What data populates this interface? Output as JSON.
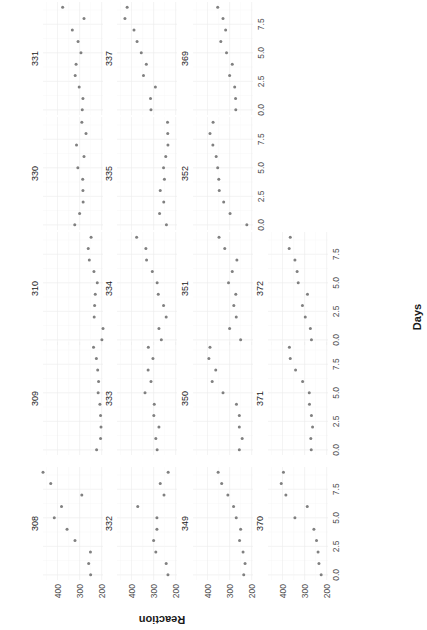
{
  "chart_data": {
    "type": "scatter",
    "title": "",
    "xlabel": "Days",
    "ylabel": "Reaction",
    "x_ticks": [
      "0.0",
      "2.5",
      "5.0",
      "7.5"
    ],
    "y_ticks": [
      "200",
      "300",
      "400"
    ],
    "xlim": [
      -0.45,
      9.45
    ],
    "ylim": [
      194,
      466
    ],
    "grid": true,
    "legend": "none",
    "facet_layout": {
      "ncol": 5,
      "nrow": 4
    },
    "x": [
      0,
      1,
      2,
      3,
      4,
      5,
      6,
      7,
      8,
      9
    ],
    "facets": [
      {
        "subject": "308",
        "values": [
          250,
          259,
          251,
          321,
          357,
          415,
          382,
          290,
          431,
          466
        ]
      },
      {
        "subject": "309",
        "values": [
          223,
          205,
          203,
          205,
          208,
          216,
          214,
          218,
          224,
          237
        ]
      },
      {
        "subject": "310",
        "values": [
          199,
          194,
          234,
          232,
          229,
          220,
          235,
          256,
          261,
          248
        ]
      },
      {
        "subject": "330",
        "values": [
          322,
          300,
          284,
          285,
          286,
          308,
          280,
          314,
          271,
          290
        ]
      },
      {
        "subject": "331",
        "values": [
          288,
          285,
          302,
          320,
          316,
          294,
          307,
          333,
          280,
          377
        ]
      },
      {
        "subject": "332",
        "values": [
          235,
          243,
          290,
          300,
          285,
          285,
          372,
          253,
          270,
          234
        ]
      },
      {
        "subject": "333",
        "values": [
          284,
          290,
          276,
          299,
          297,
          339,
          312,
          325,
          303,
          324
        ]
      },
      {
        "subject": "334",
        "values": [
          265,
          276,
          243,
          255,
          279,
          284,
          306,
          332,
          335,
          377
        ]
      },
      {
        "subject": "335",
        "values": [
          242,
          273,
          254,
          270,
          251,
          255,
          245,
          235,
          236,
          237
        ]
      },
      {
        "subject": "337",
        "values": [
          312,
          314,
          292,
          346,
          333,
          356,
          375,
          389,
          430,
          420
        ]
      },
      {
        "subject": "349",
        "values": [
          236,
          230,
          239,
          255,
          250,
          270,
          282,
          308,
          336,
          352
        ]
      },
      {
        "subject": "350",
        "values": [
          256,
          243,
          256,
          256,
          269,
          330,
          379,
          363,
          394,
          389
        ]
      },
      {
        "subject": "351",
        "values": [
          250,
          300,
          270,
          281,
          272,
          305,
          288,
          267,
          322,
          348
        ]
      },
      {
        "subject": "352",
        "values": [
          222,
          298,
          327,
          347,
          349,
          354,
          361,
          376,
          389,
          375
        ]
      },
      {
        "subject": "369",
        "values": [
          272,
          273,
          277,
          300,
          288,
          314,
          340,
          318,
          330,
          354
        ]
      },
      {
        "subject": "370",
        "values": [
          225,
          235,
          239,
          246,
          258,
          344,
          288,
          385,
          406,
          396
        ]
      },
      {
        "subject": "371",
        "values": [
          270,
          272,
          264,
          269,
          278,
          279,
          309,
          341,
          365,
          369
        ]
      },
      {
        "subject": "372",
        "values": [
          269,
          274,
          297,
          310,
          287,
          329,
          334,
          344,
          370,
          365
        ]
      }
    ],
    "point_color": "#808080",
    "grid_color": "#ebebeb"
  }
}
